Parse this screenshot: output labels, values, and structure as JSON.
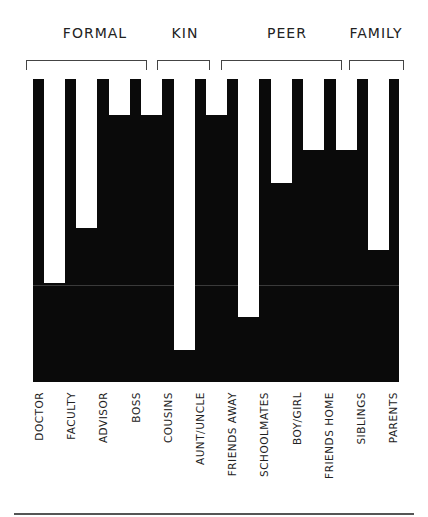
{
  "chart_data": {
    "type": "bar",
    "orientation": "inverted-vertical (white bars hang from top on black field)",
    "title": "",
    "xlabel": "",
    "ylabel": "",
    "grid": false,
    "groups": [
      {
        "label": "FORMAL",
        "members": [
          "DOCTOR",
          "FACULTY",
          "ADVISOR",
          "BOSS"
        ]
      },
      {
        "label": "KIN",
        "members": [
          "COUSINS",
          "AUNT/UNCLE"
        ]
      },
      {
        "label": "PEER",
        "members": [
          "FRIENDS AWAY",
          "SCHOOLMATES",
          "BOY/GIRL",
          "FRIENDS HOME"
        ]
      },
      {
        "label": "FAMILY",
        "members": [
          "SIBLINGS",
          "PARENTS"
        ]
      }
    ],
    "categories": [
      "DOCTOR",
      "FACULTY",
      "ADVISOR",
      "BOSS",
      "COUSINS",
      "AUNT/UNCLE",
      "FRIENDS AWAY",
      "SCHOOLMATES",
      "BOY/GIRL",
      "FRIENDS HOME",
      "SIBLINGS",
      "PARENTS"
    ],
    "display_labels": [
      "DOCTOR",
      "FACULTY",
      "ADVISOR",
      "BOSS",
      "COUSINS",
      "AUNT/UNCLE",
      "FRIENDS AWAY",
      "SCHOOLMATES",
      "BOY/GIRL",
      "FRIENDS HOME",
      "SIBLINGS",
      "PARENTS"
    ],
    "values_px_depth": [
      204,
      149,
      36,
      36,
      271,
      36,
      238,
      104,
      71,
      71,
      171,
      36
    ],
    "plot_height_px": 303,
    "gridline_px": 206
  },
  "colors": {
    "background": "#ffffff",
    "field": "#0a0a0a",
    "bar": "#ffffff",
    "text": "#222222"
  }
}
